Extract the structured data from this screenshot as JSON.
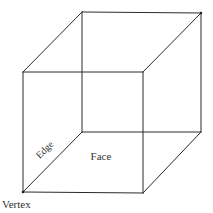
{
  "diagram": {
    "type": "cube-wireframe",
    "labels": {
      "edge": "Edge",
      "face": "Face",
      "vertex": "Vertex"
    },
    "colors": {
      "line": "#2a2a2a",
      "text": "#333333",
      "background": "#ffffff"
    },
    "vertices": {
      "back_top_left": [
        82,
        12
      ],
      "back_top_right": [
        201,
        13
      ],
      "back_bottom_left": [
        82,
        132
      ],
      "back_bottom_right": [
        201,
        132
      ],
      "front_top_left": [
        23,
        72
      ],
      "front_top_right": [
        143,
        72
      ],
      "front_bottom_left": [
        23,
        192
      ],
      "front_bottom_right": [
        143,
        193
      ]
    }
  }
}
